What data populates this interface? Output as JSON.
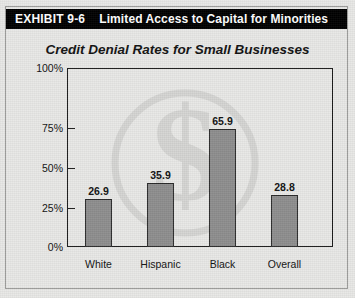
{
  "exhibit": {
    "number": "EXHIBIT 9-6",
    "title": "Limited Access to Capital for Minorities"
  },
  "watermark": {
    "icon": "dollar-sign-circle-watermark",
    "glyph": "$"
  },
  "chart_data": {
    "type": "bar",
    "title": "Credit Denial Rates for Small Businesses",
    "xlabel": "",
    "ylabel": "",
    "categories": [
      "White",
      "Hispanic",
      "Black",
      "Overall"
    ],
    "values": [
      26.9,
      35.9,
      65.9,
      28.8
    ],
    "value_labels": [
      "26.9",
      "35.9",
      "65.9",
      "28.8"
    ],
    "ylim": [
      0,
      100
    ],
    "yticks": [
      0,
      25,
      50,
      75,
      100
    ],
    "ytick_labels": [
      "0%",
      "25%",
      "50%",
      "75%",
      "100%"
    ],
    "grid": false,
    "legend": null,
    "bar_color": "#8e8e8e",
    "bar_edge_color": "#2a2a2a"
  }
}
